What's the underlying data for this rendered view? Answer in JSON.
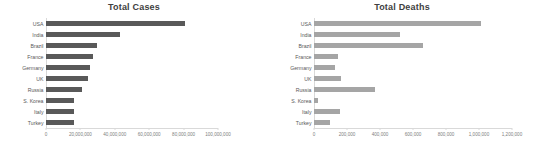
{
  "chart_data": [
    {
      "type": "bar",
      "orientation": "horizontal",
      "title": "Total Cases",
      "xlabel": "",
      "ylabel": "",
      "categories": [
        "USA",
        "India",
        "Brazil",
        "France",
        "Germany",
        "UK",
        "Russia",
        "S. Korea",
        "Italy",
        "Turkey"
      ],
      "values": [
        81000000,
        43000000,
        29800000,
        27500000,
        25500000,
        24500000,
        21000000,
        16500000,
        16500000,
        16000000
      ],
      "xlim": [
        0,
        100000000
      ],
      "xticks": [
        0,
        20000000,
        40000000,
        60000000,
        80000000,
        100000000
      ],
      "xticklabels": [
        "0",
        "20,000,000",
        "40,000,000",
        "60,000,000",
        "80,000,000",
        "100,000,000"
      ],
      "bar_color": "#595959",
      "grid": false,
      "legend": "none"
    },
    {
      "type": "bar",
      "orientation": "horizontal",
      "title": "Total Deaths",
      "xlabel": "",
      "ylabel": "",
      "categories": [
        "USA",
        "India",
        "Brazil",
        "France",
        "Germany",
        "UK",
        "Russia",
        "S. Korea",
        "Italy",
        "Turkey"
      ],
      "values": [
        1010000,
        521000,
        662000,
        143000,
        130000,
        165000,
        368000,
        25000,
        158000,
        98000
      ],
      "xlim": [
        0,
        1200000
      ],
      "xticks": [
        0,
        200000,
        400000,
        600000,
        800000,
        1000000,
        1200000
      ],
      "xticklabels": [
        "0",
        "200,000",
        "400,000",
        "600,000",
        "800,000",
        "1,000,000",
        "1,200,000"
      ],
      "bar_color": "#a5a5a5",
      "grid": false,
      "legend": "none"
    }
  ]
}
